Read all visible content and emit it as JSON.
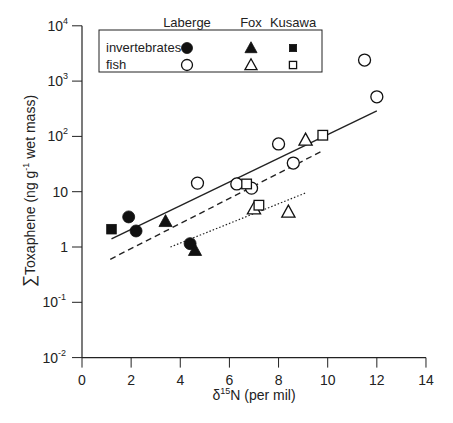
{
  "chart_data": {
    "type": "scatter",
    "title": "",
    "xlabel": "δ15N (per mil)",
    "xlabel_parts": {
      "delta": "δ",
      "sup": "15",
      "rest": "N (per mil)"
    },
    "ylabel": "ΣToxaphene (ng g-1 wet mass)",
    "ylabel_parts": {
      "sigma": "∑",
      "pre": "Toxaphene (ng g",
      "sup": "-1",
      "post": " wet mass)"
    },
    "xlim": [
      0,
      14
    ],
    "ylim": [
      0.01,
      10000
    ],
    "yscale": "log",
    "x_ticks": [
      "0",
      "2",
      "4",
      "6",
      "8",
      "10",
      "12",
      "14"
    ],
    "y_ticks": [
      {
        "base": "10",
        "exp": "4",
        "value": 10000
      },
      {
        "base": "10",
        "exp": "3",
        "value": 1000
      },
      {
        "base": "10",
        "exp": "2",
        "value": 100
      },
      {
        "base": "10",
        "exp": "",
        "value": 10
      },
      {
        "base": "1",
        "exp": "",
        "value": 1
      },
      {
        "base": "10",
        "exp": "-1",
        "value": 0.1
      },
      {
        "base": "10",
        "exp": "-2",
        "value": 0.01
      }
    ],
    "grid": false,
    "legend": {
      "position": "upper-left",
      "columns": [
        "Laberge",
        "Fox",
        "Kusawa"
      ],
      "rows": [
        "invertebrates",
        "fish"
      ]
    },
    "series": [
      {
        "name": "Laberge invertebrates",
        "marker": "circle",
        "filled": true,
        "points": [
          [
            1.9,
            3.5
          ],
          [
            2.2,
            1.95
          ],
          [
            4.4,
            1.15
          ]
        ]
      },
      {
        "name": "Fox invertebrates",
        "marker": "triangle",
        "filled": true,
        "points": [
          [
            3.4,
            2.9
          ],
          [
            4.6,
            0.87
          ]
        ]
      },
      {
        "name": "Kusawa invertebrates",
        "marker": "square",
        "filled": true,
        "points": [
          [
            1.2,
            2.1
          ]
        ]
      },
      {
        "name": "Laberge fish",
        "marker": "circle",
        "filled": false,
        "points": [
          [
            4.7,
            14.3
          ],
          [
            6.3,
            13.8
          ],
          [
            6.9,
            11.6
          ],
          [
            8.0,
            73
          ],
          [
            8.6,
            33
          ],
          [
            11.5,
            2400
          ],
          [
            12.0,
            520
          ]
        ]
      },
      {
        "name": "Fox fish",
        "marker": "triangle",
        "filled": false,
        "points": [
          [
            7.0,
            4.9
          ],
          [
            8.4,
            4.3
          ],
          [
            9.1,
            86
          ]
        ]
      },
      {
        "name": "Kusawa fish",
        "marker": "square",
        "filled": false,
        "points": [
          [
            6.7,
            13.8
          ],
          [
            7.2,
            5.7
          ],
          [
            9.8,
            105
          ]
        ]
      }
    ],
    "regression_lines": [
      {
        "name": "Laberge",
        "style": "solid",
        "from": [
          1.2,
          1.4
        ],
        "to": [
          12.0,
          290
        ]
      },
      {
        "name": "Kusawa",
        "style": "dashed",
        "from": [
          1.15,
          0.6
        ],
        "to": [
          9.8,
          55
        ]
      },
      {
        "name": "Fox",
        "style": "dotted",
        "from": [
          3.6,
          1.0
        ],
        "to": [
          9.1,
          9.5
        ]
      }
    ]
  }
}
